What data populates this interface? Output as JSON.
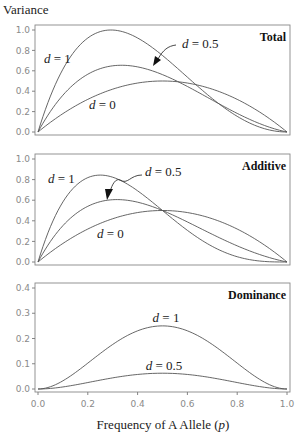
{
  "chart_data": {
    "type": "line",
    "ylabel": "Variance",
    "xlabel": "Frequency of A Allele (p)",
    "xlim": [
      0,
      1
    ],
    "x_ticks": [
      "0.0",
      "0.2",
      "0.4",
      "0.6",
      "0.8",
      "1.0"
    ],
    "panels": [
      {
        "title": "Total",
        "ylim": [
          0,
          1.0
        ],
        "y_ticks": [
          "0.0",
          "0.2",
          "0.4",
          "0.6",
          "0.8",
          "1.0"
        ],
        "series": [
          {
            "name": "d = 1",
            "x": [
              0,
              0.1,
              0.2,
              0.3,
              0.4,
              0.5,
              0.6,
              0.7,
              0.8,
              0.9,
              1.0
            ],
            "values": [
              0,
              0.6498,
              0.9216,
              0.9996,
              0.9216,
              0.75,
              0.5376,
              0.3276,
              0.1536,
              0.0396,
              0
            ]
          },
          {
            "name": "d = 0.5",
            "x": [
              0,
              0.1,
              0.2,
              0.3,
              0.4,
              0.5,
              0.6,
              0.7,
              0.8,
              0.9,
              1.0
            ],
            "values": [
              0,
              0.3888,
              0.5824,
              0.6384,
              0.6048,
              0.5625,
              0.4416,
              0.2989,
              0.1664,
              0.0573,
              0
            ]
          },
          {
            "name": "d = 0",
            "x": [
              0,
              0.1,
              0.2,
              0.3,
              0.4,
              0.5,
              0.6,
              0.7,
              0.8,
              0.9,
              1.0
            ],
            "values": [
              0,
              0.18,
              0.32,
              0.42,
              0.48,
              0.5,
              0.48,
              0.42,
              0.32,
              0.18,
              0
            ]
          }
        ],
        "annotations": [
          "d = 1",
          "d = 0.5",
          "d = 0",
          "Total"
        ]
      },
      {
        "title": "Additive",
        "ylim": [
          0,
          1.0
        ],
        "y_ticks": [
          "0.0",
          "0.2",
          "0.4",
          "0.6",
          "0.8",
          "1.0"
        ],
        "series": [
          {
            "name": "d = 1",
            "x": [
              0,
              0.1,
              0.2,
              0.3,
              0.4,
              0.5,
              0.6,
              0.7,
              0.8,
              0.9,
              1.0
            ],
            "values": [
              0,
              0.6174,
              0.8192,
              0.8232,
              0.6912,
              0.5,
              0.3072,
              0.1512,
              0.0512,
              0.0072,
              0
            ]
          },
          {
            "name": "d = 0.5",
            "x": [
              0,
              0.1,
              0.2,
              0.3,
              0.4,
              0.5,
              0.6,
              0.7,
              0.8,
              0.9,
              1.0
            ],
            "values": [
              0,
              0.3698,
              0.5408,
              0.5978,
              0.5808,
              0.5,
              0.3888,
              0.2625,
              0.1568,
              0.0488,
              0
            ]
          },
          {
            "name": "d = 0",
            "x": [
              0,
              0.1,
              0.2,
              0.3,
              0.4,
              0.5,
              0.6,
              0.7,
              0.8,
              0.9,
              1.0
            ],
            "values": [
              0,
              0.18,
              0.32,
              0.42,
              0.48,
              0.5,
              0.48,
              0.42,
              0.32,
              0.18,
              0
            ]
          }
        ],
        "annotations": [
          "d = 1",
          "d = 0.5",
          "d = 0",
          "Additive"
        ]
      },
      {
        "title": "Dominance",
        "ylim": [
          0,
          0.4
        ],
        "y_ticks": [
          "0.0",
          "0.1",
          "0.2",
          "0.3",
          "0.4"
        ],
        "series": [
          {
            "name": "d = 1",
            "x": [
              0,
              0.1,
              0.2,
              0.3,
              0.4,
              0.5,
              0.6,
              0.7,
              0.8,
              0.9,
              1.0
            ],
            "values": [
              0,
              0.0324,
              0.1024,
              0.1764,
              0.2304,
              0.25,
              0.2304,
              0.1764,
              0.1024,
              0.0324,
              0
            ]
          },
          {
            "name": "d = 0.5",
            "x": [
              0,
              0.1,
              0.2,
              0.3,
              0.4,
              0.5,
              0.6,
              0.7,
              0.8,
              0.9,
              1.0
            ],
            "values": [
              0,
              0.0081,
              0.0256,
              0.0441,
              0.0576,
              0.0625,
              0.0576,
              0.0441,
              0.0256,
              0.0081,
              0
            ]
          }
        ],
        "annotations": [
          "d = 1",
          "d = 0.5",
          "Dominance"
        ]
      }
    ],
    "grid": false,
    "legend": "inline labels"
  },
  "labels": {
    "ylabel": "Variance",
    "xlabel_main": "Frequency of A Allele (",
    "xlabel_var": "p",
    "xlabel_end": ")",
    "d1": "d = 1",
    "d05": "d = 0.5",
    "d0": "d = 0",
    "total": "Total",
    "additive": "Additive",
    "dominance": "Dominance"
  }
}
